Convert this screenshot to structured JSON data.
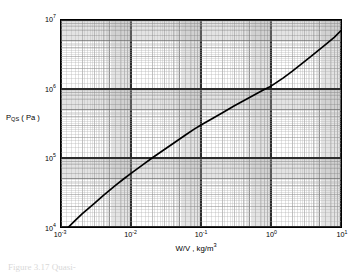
{
  "figure": {
    "caption": "Figure  3.17   Quasi-",
    "ylabel_main": "P",
    "ylabel_sub": "QS",
    "ylabel_unit": "( Pa )",
    "xlabel_main": "W/V ,  kg/m",
    "xlabel_exp": "3"
  },
  "chart_data": {
    "type": "line",
    "title": "",
    "xlabel": "W/V , kg/m^3",
    "ylabel": "P_QS ( Pa )",
    "xscale": "log",
    "yscale": "log",
    "xlim": [
      0.001,
      10
    ],
    "ylim": [
      10000,
      10000000
    ],
    "grid": true,
    "grid_style": "log-log graph paper, major and minor decade rulings",
    "legend": "none",
    "xticks": [
      0.001,
      0.01,
      0.1,
      1,
      10
    ],
    "xticklabels": [
      "10⁻³",
      "10⁻²",
      "10⁻¹",
      "10⁰",
      "10¹"
    ],
    "yticks": [
      10000,
      100000,
      1000000,
      10000000
    ],
    "yticklabels": [
      "10⁴",
      "10⁵",
      "10⁶",
      "10⁷"
    ],
    "series": [
      {
        "name": "P_QS vs W/V",
        "color": "#000000",
        "x": [
          0.00128,
          0.0016,
          0.002,
          0.003,
          0.004,
          0.006,
          0.008,
          0.01,
          0.015,
          0.02,
          0.03,
          0.04,
          0.06,
          0.08,
          0.1,
          0.15,
          0.2,
          0.3,
          0.4,
          0.6,
          0.8,
          1.0,
          1.5,
          2.0,
          3.0,
          4.0,
          6.0,
          8.0,
          10.0
        ],
        "y": [
          10000,
          12500,
          15500,
          22000,
          28500,
          40000,
          50500,
          60000,
          81000,
          100000,
          133000,
          162000,
          215000,
          262000,
          300000,
          380000,
          450000,
          570000,
          670000,
          840000,
          980000,
          1100000,
          1450000,
          1800000,
          2500000,
          3150000,
          4400000,
          5600000,
          7000000
        ]
      }
    ]
  },
  "x_tick_labels": [
    {
      "base": "10",
      "exp": "-3"
    },
    {
      "base": "10",
      "exp": "-2"
    },
    {
      "base": "10",
      "exp": "-1"
    },
    {
      "base": "10",
      "exp": "0"
    },
    {
      "base": "10",
      "exp": "1"
    }
  ],
  "y_tick_labels": [
    {
      "base": "10",
      "exp": "7"
    },
    {
      "base": "10",
      "exp": "6"
    },
    {
      "base": "10",
      "exp": "5"
    },
    {
      "base": "10",
      "exp": "4"
    }
  ]
}
